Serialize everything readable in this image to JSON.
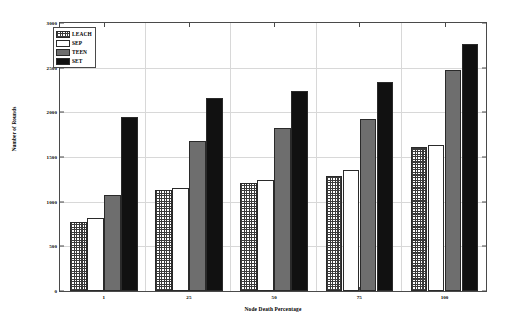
{
  "chart_data": {
    "type": "bar",
    "title": "",
    "xlabel": "Node Death Percentage",
    "ylabel": "Number of Rounds",
    "categories": [
      "1",
      "25",
      "50",
      "75",
      "100"
    ],
    "series": [
      {
        "name": "LEACH",
        "values": [
          770,
          1130,
          1210,
          1290,
          1610
        ],
        "fill": "checker",
        "color": "#ffffff"
      },
      {
        "name": "SEP",
        "values": [
          820,
          1150,
          1240,
          1350,
          1630
        ],
        "fill": "dots",
        "color": "#ffffff"
      },
      {
        "name": "TEEN",
        "values": [
          1080,
          1680,
          1820,
          1920,
          2470
        ],
        "fill": "solid",
        "color": "#6e6e6e"
      },
      {
        "name": "SET",
        "values": [
          1950,
          2160,
          2240,
          2340,
          2770
        ],
        "fill": "solid",
        "color": "#111111"
      }
    ],
    "ylim": [
      0,
      3000
    ],
    "yticks": [
      0,
      500,
      1000,
      1500,
      2000,
      2500,
      3000
    ],
    "ytick_labels": [
      "0",
      "500",
      "1000",
      "1500",
      "2000",
      "2500",
      "3000"
    ],
    "grid": true,
    "legend_position": "top-left"
  },
  "legend": {
    "entries": [
      {
        "label": "LEACH"
      },
      {
        "label": "SEP"
      },
      {
        "label": "TEEN"
      },
      {
        "label": "SET"
      }
    ]
  }
}
